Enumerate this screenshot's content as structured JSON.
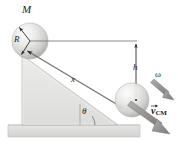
{
  "figure": {
    "background": "#ffffff"
  },
  "labels": {
    "mass": "M",
    "radius": "R",
    "distance": "x",
    "height": "h",
    "angle": "θ",
    "angular_velocity": "ω",
    "vcm_symbol": "v",
    "vcm_subscript": "CM"
  },
  "colors": {
    "incline_fill": "#e4e4e2",
    "incline_edge": "#b9b9b6",
    "ground_fill": "#dedede",
    "ground_edge": "#c3c3c1",
    "sphere_light": "#fbfbfb",
    "sphere_mid": "#dcdcda",
    "sphere_dark": "#b6b6b3",
    "line": "#6f6f6d",
    "arrow_dark": "#3a3a3a",
    "thick_arrow": "#8d8d8b",
    "text": "#1c1c1c"
  },
  "geometry": {
    "top_sphere_center": [
      30,
      41
    ],
    "top_sphere_radius": 18,
    "bottom_sphere_center": [
      132,
      100
    ],
    "bottom_sphere_radius": 17,
    "height_line_x": 136,
    "height_line_top_y": 41,
    "height_line_bottom_y": 100,
    "incline_angle_degrees": 30
  }
}
